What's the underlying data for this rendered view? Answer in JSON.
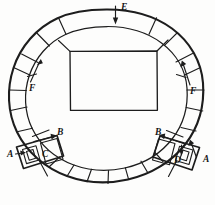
{
  "figure": {
    "kind": "line-drawing",
    "width": 215,
    "height": 205,
    "ink_color": "#1d1d1d",
    "background_color": "#fdfdfc"
  },
  "labels": {
    "e_top": "E",
    "f_left": "F",
    "f_right": "F",
    "b_left": "B",
    "b_right": "B",
    "a_left": "A",
    "a_right": "A",
    "c_left": "C",
    "d_right": "D"
  },
  "callouts": [
    {
      "id": "E",
      "text": "E",
      "x": 121,
      "y": 7,
      "arrow": "down"
    },
    {
      "id": "F-left",
      "text": "F",
      "x": 32,
      "y": 85,
      "arrow": "up-right"
    },
    {
      "id": "F-right",
      "text": "F",
      "x": 193,
      "y": 88,
      "arrow": "up-left"
    },
    {
      "id": "B-left",
      "text": "B",
      "x": 58,
      "y": 134,
      "arrow": "right"
    },
    {
      "id": "B-right",
      "text": "B",
      "x": 157,
      "y": 134,
      "arrow": "left"
    },
    {
      "id": "A-left",
      "text": "A",
      "x": 9,
      "y": 155,
      "arrow": "right"
    },
    {
      "id": "A-right",
      "text": "A",
      "x": 206,
      "y": 158,
      "arrow": "left"
    },
    {
      "id": "C",
      "text": "C",
      "x": 45,
      "y": 155,
      "arrow": "none"
    },
    {
      "id": "D",
      "text": "D",
      "x": 178,
      "y": 160,
      "arrow": "none"
    }
  ],
  "geometry": {
    "ring_center_x": 107,
    "ring_center_y": 104,
    "outer_radius": 96,
    "inner_radius": 78,
    "segment_count": 20,
    "court": {
      "x": 70,
      "y": 51,
      "width": 87,
      "height": 59
    }
  }
}
